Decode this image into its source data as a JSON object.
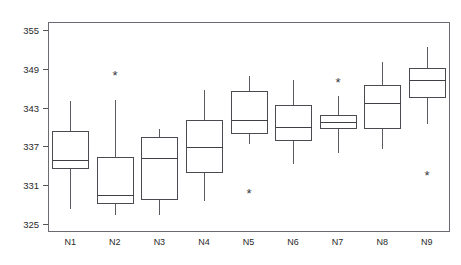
{
  "chart_data": {
    "type": "box",
    "title": "",
    "subtitle": "",
    "xlabel": "",
    "ylabel": "",
    "categories": [
      "N1",
      "N2",
      "N3",
      "N4",
      "N5",
      "N6",
      "N7",
      "N8",
      "N9"
    ],
    "ylim": [
      323.5,
      356.5
    ],
    "yticks": [
      325,
      331,
      337,
      343,
      349,
      355
    ],
    "ytick_labels": [
      "325",
      "331",
      "337",
      "343",
      "349",
      "355"
    ],
    "grid": false,
    "legend": null,
    "legend_position": "none",
    "frame": true,
    "boxes": [
      {
        "category": "N1",
        "whisker_low": 327.5,
        "q1": 333.7,
        "median": 334.9,
        "q3": 339.4,
        "whisker_high": 344.2,
        "outliers": []
      },
      {
        "category": "N2",
        "whisker_low": 326.6,
        "q1": 328.2,
        "median": 329.5,
        "q3": 335.4,
        "whisker_high": 344.3,
        "outliers": [
          348.0
        ]
      },
      {
        "category": "N3",
        "whisker_low": 326.6,
        "q1": 328.9,
        "median": 335.2,
        "q3": 338.5,
        "whisker_high": 339.8,
        "outliers": []
      },
      {
        "category": "N4",
        "whisker_low": 328.7,
        "q1": 333.0,
        "median": 336.9,
        "q3": 341.1,
        "whisker_high": 345.9,
        "outliers": []
      },
      {
        "category": "N5",
        "whisker_low": 337.5,
        "q1": 339.1,
        "median": 341.1,
        "q3": 345.6,
        "whisker_high": 348.0,
        "outliers": [
          329.8
        ]
      },
      {
        "category": "N6",
        "whisker_low": 334.4,
        "q1": 338.0,
        "median": 340.0,
        "q3": 343.4,
        "whisker_high": 347.4,
        "outliers": []
      },
      {
        "category": "N7",
        "whisker_low": 336.1,
        "q1": 339.9,
        "median": 340.8,
        "q3": 341.9,
        "whisker_high": 344.9,
        "outliers": [
          346.9
        ]
      },
      {
        "category": "N8",
        "whisker_low": 336.8,
        "q1": 339.9,
        "median": 343.7,
        "q3": 346.5,
        "whisker_high": 350.2,
        "outliers": []
      },
      {
        "category": "N9",
        "whisker_low": 340.6,
        "q1": 344.6,
        "median": 347.3,
        "q3": 349.1,
        "whisker_high": 352.5,
        "outliers": [
          332.6
        ]
      }
    ],
    "outlier_symbol": "*"
  }
}
